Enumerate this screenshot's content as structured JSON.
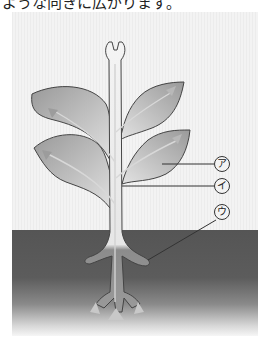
{
  "caption": "ような向きに広がります。",
  "diagram": {
    "labels": [
      {
        "id": "a",
        "text": "ア",
        "points_to": "leaf vein"
      },
      {
        "id": "i",
        "text": "イ",
        "points_to": "stem vessel"
      },
      {
        "id": "u",
        "text": "ウ",
        "points_to": "root"
      }
    ]
  },
  "colors": {
    "background": "#f3f3f3",
    "soil": "#555555",
    "leaf": "#b0b0b0",
    "outline": "#444444"
  }
}
